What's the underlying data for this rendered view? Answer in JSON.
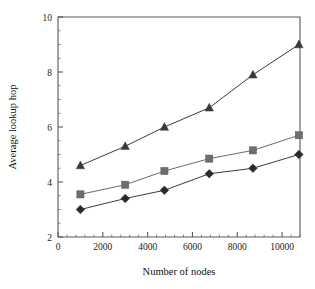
{
  "chart_data": {
    "type": "line",
    "title": "",
    "xlabel": "Number of nodes",
    "ylabel": "Average lookup hop",
    "xlim": [
      0,
      10800
    ],
    "ylim": [
      2,
      10
    ],
    "grid": false,
    "legend": "none",
    "xticks": [
      0,
      2000,
      4000,
      6000,
      8000,
      10000
    ],
    "xticklabels": [
      "0",
      "2000",
      "4000",
      "6000",
      "8000",
      "10000"
    ],
    "yticks": [
      2,
      4,
      6,
      8,
      10
    ],
    "yticklabels": [
      "2",
      "4",
      "6",
      "8",
      "10"
    ],
    "x": [
      1000,
      3000,
      4750,
      6750,
      8700,
      10750
    ],
    "series": [
      {
        "name": "series-diamond",
        "marker": "diamond",
        "color": "#2a2a2a",
        "values": [
          3.0,
          3.4,
          3.7,
          4.3,
          4.5,
          5.0
        ]
      },
      {
        "name": "series-square",
        "marker": "square",
        "color": "#6d6d6d",
        "values": [
          3.55,
          3.9,
          4.4,
          4.85,
          5.15,
          5.7
        ]
      },
      {
        "name": "series-triangle",
        "marker": "triangle",
        "color": "#3a3a3a",
        "values": [
          4.6,
          5.3,
          6.0,
          6.7,
          7.9,
          9.0
        ]
      }
    ]
  }
}
